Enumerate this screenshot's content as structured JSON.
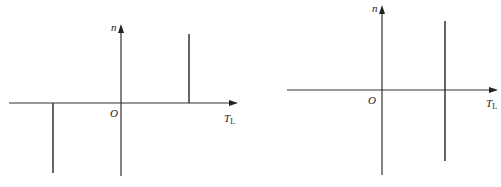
{
  "diagrams": [
    {
      "id": "left",
      "axes": {
        "y_label": "n",
        "origin_label": "O",
        "x_label_main": "T",
        "x_label_sub": "L"
      },
      "description": "Mechanical characteristic n vs T_L: vertical line at positive T_L above axis, vertical line at negative T_L below axis"
    },
    {
      "id": "right",
      "axes": {
        "y_label": "n",
        "origin_label": "O",
        "x_label_main": "T",
        "x_label_sub": "L"
      },
      "description": "Mechanical characteristic n vs T_L: single vertical line at positive T_L spanning above and below axis"
    }
  ],
  "colors": {
    "line": "#333333",
    "background": "#ffffff"
  }
}
